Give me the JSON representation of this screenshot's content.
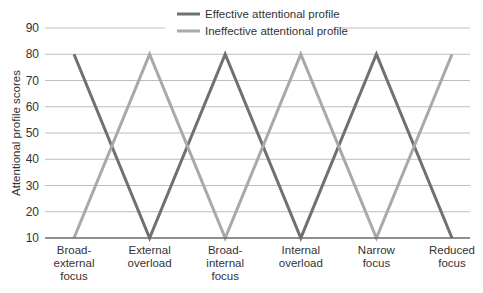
{
  "chart_data": {
    "type": "line",
    "title": "",
    "xlabel": "",
    "ylabel": "Attentional profile scores",
    "categories": [
      [
        "Broad-",
        "external",
        "focus"
      ],
      [
        "External",
        "overload"
      ],
      [
        "Broad-",
        "internal",
        "focus"
      ],
      [
        "Internal",
        "overload"
      ],
      [
        "Narrow",
        "focus"
      ],
      [
        "Reduced",
        "focus"
      ]
    ],
    "category_names": [
      "Broad-external focus",
      "External overload",
      "Broad-internal focus",
      "Internal overload",
      "Narrow focus",
      "Reduced focus"
    ],
    "series": [
      {
        "name": "Effective attentional profile",
        "color": "#707070",
        "values": [
          80,
          10,
          80,
          10,
          80,
          10
        ]
      },
      {
        "name": "Ineffective attentional profile",
        "color": "#a9a9a9",
        "values": [
          10,
          80,
          10,
          80,
          10,
          80
        ]
      }
    ],
    "ylim": [
      10,
      90
    ],
    "yticks": [
      10,
      20,
      30,
      40,
      50,
      60,
      70,
      80,
      90
    ],
    "grid": true,
    "legend_position": "top-center"
  }
}
